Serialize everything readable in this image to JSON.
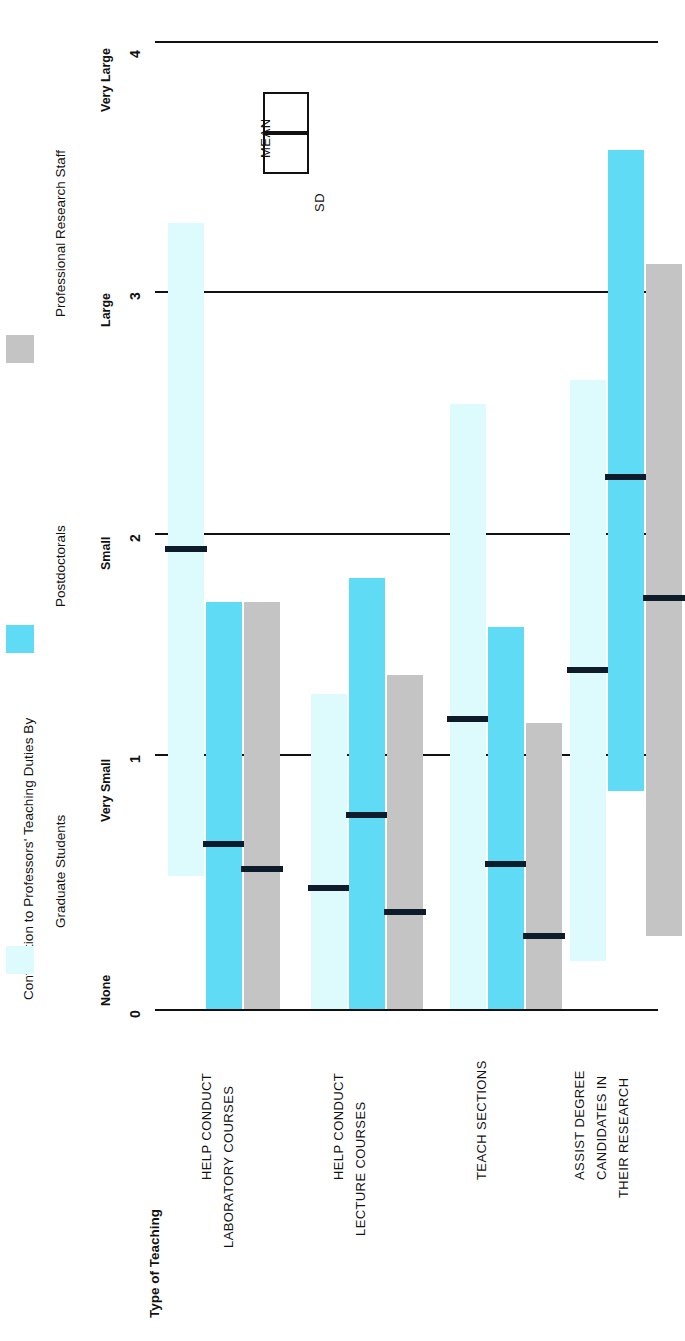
{
  "figure": {
    "legend_title": "Contribution to Professors' Teaching Duties By",
    "value_axis_title": "",
    "category_axis_title": "Type of Teaching"
  },
  "legend": {
    "items": [
      {
        "label": "Graduate Students",
        "color": "#DDFAFD",
        "swatch_name": "legend-swatch-graduate-students"
      },
      {
        "label": "Postdoctorals",
        "color": "#5FDBF5",
        "swatch_name": "legend-swatch-postdoctorals"
      },
      {
        "label": "Professional Research Staff",
        "color": "#C4C4C4",
        "swatch_name": "legend-swatch-professional-research-staff"
      }
    ]
  },
  "key": {
    "mean_label": "MEAN",
    "sd_label": "SD"
  },
  "axis": {
    "tick_numbers": [
      "0",
      "1",
      "2",
      "3",
      "4"
    ],
    "tick_names": [
      "None",
      "Very Small",
      "Small",
      "Large",
      "Very Large"
    ]
  },
  "chart_data": {
    "type": "bar",
    "title": "Contribution to Professors' Teaching Duties By",
    "xlabel": "Type of Teaching",
    "ylabel": "",
    "ylim": [
      0,
      4
    ],
    "grid": true,
    "legend_position": "top-left",
    "orientation": "vertical-rotated-90ccw",
    "notation": "Each bar spans mean ± SD; black line marks the MEAN.",
    "ytick_values": [
      0,
      1,
      2,
      3,
      4
    ],
    "ytick_labels": [
      "None",
      "Very Small",
      "Small",
      "Large",
      "Very Large"
    ],
    "categories": [
      "HELP CONDUCT LABORATORY COURSES",
      "HELP CONDUCT LECTURE COURSES",
      "TEACH SECTIONS",
      "ASSIST DEGREE CANDIDATES IN THEIR RESEARCH"
    ],
    "series": [
      {
        "name": "Graduate Students",
        "color": "#DDFAFD",
        "means": [
          1.9,
          0.5,
          1.2,
          1.4
        ],
        "sd_low": [
          0.55,
          0.0,
          0.0,
          0.2
        ],
        "sd_high": [
          3.25,
          1.3,
          2.5,
          2.6
        ]
      },
      {
        "name": "Postdoctorals",
        "color": "#5FDBF5",
        "means": [
          0.68,
          0.8,
          0.6,
          2.2
        ],
        "sd_low": [
          0.0,
          0.0,
          0.0,
          0.9
        ],
        "sd_high": [
          1.68,
          1.78,
          1.58,
          3.55
        ]
      },
      {
        "name": "Professional Research Staff",
        "color": "#C4C4C4",
        "means": [
          0.58,
          0.4,
          0.3,
          1.7
        ],
        "sd_low": [
          0.0,
          0.0,
          0.0,
          0.3
        ],
        "sd_high": [
          1.68,
          1.38,
          1.18,
          3.08
        ]
      }
    ]
  },
  "categories_display": [
    {
      "lines": [
        "HELP CONDUCT",
        "LABORATORY COURSES"
      ]
    },
    {
      "lines": [
        "HELP CONDUCT",
        "LECTURE COURSES"
      ]
    },
    {
      "lines": [
        "TEACH SECTIONS"
      ]
    },
    {
      "lines": [
        "ASSIST DEGREE",
        "CANDIDATES IN",
        "THEIR RESEARCH"
      ]
    }
  ]
}
